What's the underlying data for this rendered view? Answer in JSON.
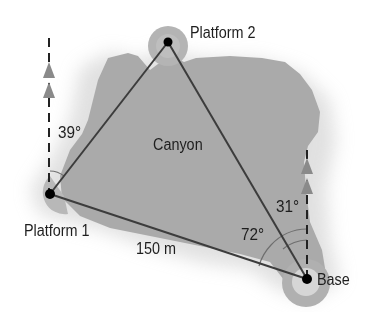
{
  "diagram": {
    "type": "bearing-triangle",
    "region_label": "Canyon",
    "points": [
      {
        "id": "platform1",
        "label": "Platform 1",
        "x": 50,
        "y": 194
      },
      {
        "id": "platform2",
        "label": "Platform 2",
        "x": 168,
        "y": 42
      },
      {
        "id": "base",
        "label": "Base",
        "x": 307,
        "y": 279
      }
    ],
    "edges": [
      {
        "from": "platform1",
        "to": "platform2",
        "label": ""
      },
      {
        "from": "platform2",
        "to": "base",
        "label": ""
      },
      {
        "from": "platform1",
        "to": "base",
        "label": "150 m"
      }
    ],
    "angles": [
      {
        "at": "platform1",
        "label": "39°",
        "between": [
          "north",
          "platform2"
        ]
      },
      {
        "at": "base",
        "label": "31°",
        "between": [
          "north",
          "platform2"
        ]
      },
      {
        "at": "base",
        "label": "72°",
        "between": [
          "platform1",
          "north"
        ]
      }
    ],
    "north_lines": [
      {
        "at": "platform1",
        "style": "dashed",
        "arrows": 2
      },
      {
        "at": "base",
        "style": "dashed",
        "arrows": 2
      }
    ],
    "labels": {
      "platform1": "Platform 1",
      "platform2": "Platform 2",
      "base": "Base",
      "canyon": "Canyon",
      "distance": "150 m",
      "angle_platform1": "39°",
      "angle_base_north": "31°",
      "angle_base_side": "72°"
    },
    "colors": {
      "canyon_fill": "#a9a9a9",
      "canyon_halo": "#cfcfcf",
      "line": "#3c3c3c",
      "arrow": "#8a8a8a",
      "point": "#000000",
      "text": "#1e1e1e"
    }
  }
}
